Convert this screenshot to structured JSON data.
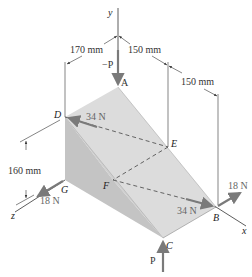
{
  "axes": {
    "x": "x",
    "y": "y",
    "z": "z"
  },
  "points": {
    "A": "A",
    "B": "B",
    "C": "C",
    "D": "D",
    "E": "E",
    "F": "F",
    "G": "G"
  },
  "dimensions": {
    "d1": "170 mm",
    "d2": "150 mm",
    "d3": "150 mm",
    "d4": "160 mm"
  },
  "forces": {
    "minus_p": "−P",
    "p": "P",
    "f_d": "34 N",
    "f_b": "34 N",
    "f_g": "18 N",
    "f_b2": "18 N"
  },
  "colors": {
    "top_face": "#d4d4d4",
    "side_face": "#bdbdbd",
    "front_face": "#e6e6e6",
    "arrow": "#7a7a7a",
    "line": "#555555"
  }
}
